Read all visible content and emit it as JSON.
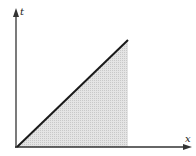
{
  "diagram": {
    "axes": {
      "x_label": "x",
      "y_label": "t"
    },
    "line": {
      "description": "straight line from origin rising to the upper right",
      "color": "#1a1a1a"
    },
    "shaded_region": {
      "description": "triangular region under the line, bounded by the x-axis and a vertical edge",
      "fill": "#d6d6d6"
    },
    "colors": {
      "axis": "#333333",
      "background": "#ffffff"
    }
  }
}
